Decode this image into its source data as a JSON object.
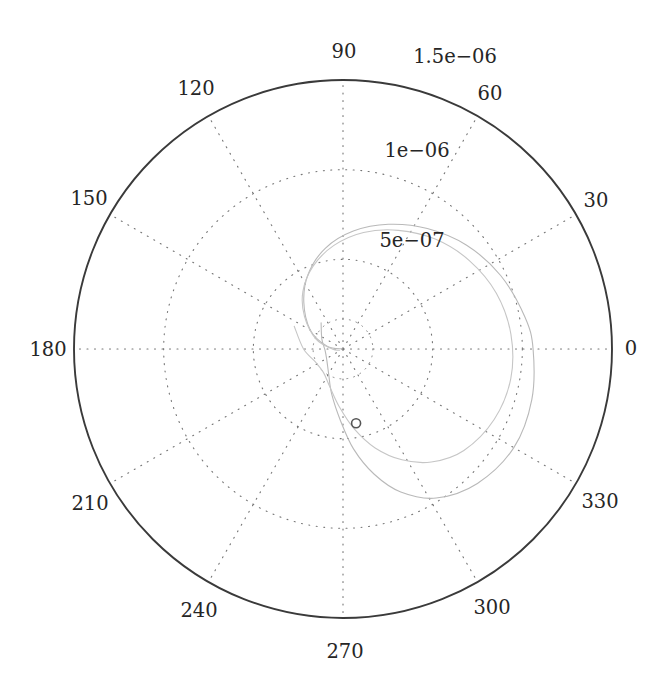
{
  "figure": {
    "type": "polar-plot",
    "background": "#ffffff",
    "width": 672,
    "height": 697,
    "center": {
      "x": 343,
      "y": 349
    },
    "outer_radius_px": 269
  },
  "axes": {
    "outer_ring_color": "#3a3a3a",
    "grid_color": "#6e6e6e",
    "grid_style": "dotted",
    "angle_tick_step_deg": 30,
    "angle_labels": [
      {
        "text": "0",
        "deg": 0
      },
      {
        "text": "30",
        "deg": 30
      },
      {
        "text": "60",
        "deg": 60
      },
      {
        "text": "90",
        "deg": 90
      },
      {
        "text": "120",
        "deg": 120
      },
      {
        "text": "150",
        "deg": 150
      },
      {
        "text": "180",
        "deg": 180
      },
      {
        "text": "210",
        "deg": 210
      },
      {
        "text": "240",
        "deg": 240
      },
      {
        "text": "270",
        "deg": 270
      },
      {
        "text": "300",
        "deg": 300
      },
      {
        "text": "330",
        "deg": 330
      }
    ],
    "radial_labels": [
      {
        "text": "5e−07",
        "value": 5e-07,
        "r_frac": 0.3333
      },
      {
        "text": "1e−06",
        "value": 1e-06,
        "r_frac": 0.6667
      },
      {
        "text": "1.5e−06",
        "value": 1.5e-06,
        "r_frac": 1.0
      }
    ],
    "radial_label_angle_deg": 75,
    "rlim": [
      0,
      1.5e-06
    ]
  },
  "chart_data": {
    "type": "line",
    "title": "",
    "xlabel": "",
    "ylabel": "",
    "coordinate_system": "polar",
    "theta_unit": "degrees",
    "r_unit": "arbitrary",
    "rlim": [
      0,
      1.5e-06
    ],
    "theta_ticks": [
      0,
      30,
      60,
      90,
      120,
      150,
      180,
      210,
      240,
      270,
      300,
      330
    ],
    "r_ticks": [
      5e-07,
      1e-06,
      1.5e-06
    ],
    "r_tick_labels": [
      "5e−07",
      "1e−06",
      "1.5e−06"
    ],
    "grid": true,
    "legend": null,
    "series": [
      {
        "name": "outer-spiral",
        "color": "#b9b9b9",
        "linewidth": 1.1,
        "points_polar": [
          [
            188,
            0.0
          ],
          [
            170,
            9e-08
          ],
          [
            150,
            2.1e-07
          ],
          [
            130,
            3.4e-07
          ],
          [
            115,
            4.6e-07
          ],
          [
            100,
            5.7e-07
          ],
          [
            85,
            6.6e-07
          ],
          [
            70,
            7.4e-07
          ],
          [
            55,
            8.2e-07
          ],
          [
            40,
            9e-07
          ],
          [
            25,
            9.7e-07
          ],
          [
            10,
            1.03e-06
          ],
          [
            0,
            1.06e-06
          ],
          [
            -15,
            1.09e-06
          ],
          [
            -30,
            1.1e-06
          ],
          [
            -45,
            1.06e-06
          ],
          [
            -58,
            9.8e-07
          ],
          [
            -68,
            8.6e-07
          ],
          [
            -76,
            7.2e-07
          ],
          [
            -84,
            5.6e-07
          ],
          [
            -92,
            4e-07
          ],
          [
            -104,
            2.6e-07
          ],
          [
            -120,
            1.6e-07
          ],
          [
            -145,
            1.1e-07
          ],
          [
            -175,
            1e-07
          ],
          [
            -205,
            1.3e-07
          ],
          [
            -230,
            1.9e-07
          ]
        ]
      },
      {
        "name": "inner-spiral",
        "color": "#c6c6c6",
        "linewidth": 1.1,
        "points_polar": [
          [
            200,
            2e-08
          ],
          [
            180,
            6e-08
          ],
          [
            160,
            1.6e-07
          ],
          [
            140,
            2.8e-07
          ],
          [
            125,
            3.9e-07
          ],
          [
            110,
            4.9e-07
          ],
          [
            95,
            5.8e-07
          ],
          [
            80,
            6.6e-07
          ],
          [
            65,
            7.3e-07
          ],
          [
            50,
            8e-07
          ],
          [
            35,
            8.6e-07
          ],
          [
            20,
            9.1e-07
          ],
          [
            5,
            9.4e-07
          ],
          [
            -10,
            9.5e-07
          ],
          [
            -25,
            9.3e-07
          ],
          [
            -40,
            8.8e-07
          ],
          [
            -52,
            8e-07
          ],
          [
            -62,
            7e-07
          ],
          [
            -72,
            5.8e-07
          ],
          [
            -82,
            4.5e-07
          ],
          [
            -94,
            3.2e-07
          ],
          [
            -110,
            2.2e-07
          ],
          [
            -130,
            1.7e-07
          ],
          [
            -155,
            1.7e-07
          ],
          [
            -180,
            2.2e-07
          ],
          [
            -205,
            3e-07
          ]
        ]
      }
    ],
    "markers": [
      {
        "name": "open-circle-marker",
        "theta_deg": 280,
        "r": 4.2e-07,
        "shape": "circle-open",
        "edge_color": "#555555",
        "size_px": 9
      }
    ]
  }
}
